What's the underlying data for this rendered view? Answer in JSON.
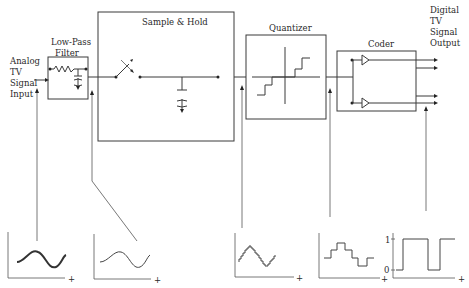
{
  "diagram": {
    "input_label": [
      "Analog",
      "TV",
      "Signal",
      "Input"
    ],
    "output_label": [
      "Digital",
      "TV",
      "Signal",
      "Output"
    ],
    "blocks": [
      {
        "id": "lpf",
        "title_lines": [
          "Low-Pass",
          "Filter"
        ]
      },
      {
        "id": "sh",
        "title": "Sample & Hold"
      },
      {
        "id": "quantizer",
        "title": "Quantizer"
      },
      {
        "id": "coder",
        "title": "Coder"
      }
    ],
    "waveforms": [
      {
        "id": "analog-noisy",
        "description": "noisy analog sine wave",
        "x_axis_label": "+"
      },
      {
        "id": "analog-filtered",
        "description": "smooth filtered sine wave",
        "x_axis_label": "+"
      },
      {
        "id": "staircase",
        "description": "sampled staircase wave",
        "x_axis_label": "+"
      },
      {
        "id": "quantized",
        "description": "quantized levels",
        "x_axis_label": "+"
      },
      {
        "id": "binary",
        "description": "binary digital pulse",
        "x_axis_label": "+",
        "y_ticks": [
          "1",
          "0"
        ]
      }
    ],
    "colors": {
      "line": "#3a3a3a",
      "background": "#ffffff"
    }
  }
}
